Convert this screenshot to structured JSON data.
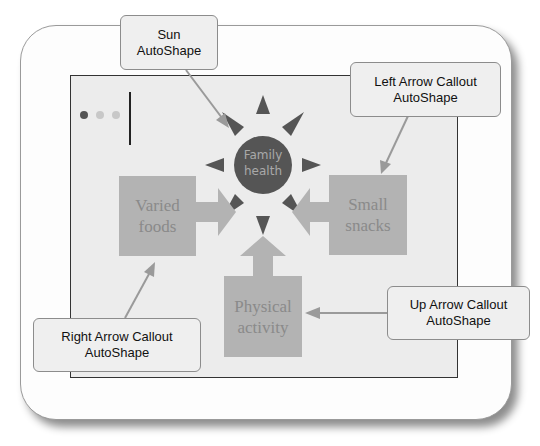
{
  "colors": {
    "slide_bg": "#ececec",
    "box_fill": "#b3b3b3",
    "box_text": "#8a8a8a",
    "sun_fill": "#555555",
    "callout_bg": "#efefef",
    "callout_border": "#8c8c8c",
    "pointer": "#9a9a9a"
  },
  "slide": {
    "bullet_dots": [
      "#555555",
      "#c8c8c8",
      "#c8c8c8"
    ]
  },
  "sun": {
    "label_line1": "Family",
    "label_line2": "health"
  },
  "boxes": {
    "varied_foods": {
      "line1": "Varied",
      "line2": "foods"
    },
    "small_snacks": {
      "line1": "Small",
      "line2": "snacks"
    },
    "physical_activity": {
      "line1": "Physical",
      "line2": "activity"
    }
  },
  "callouts": {
    "sun": {
      "line1": "Sun",
      "line2": "AutoShape"
    },
    "left_arrow": {
      "line1": "Left Arrow Callout",
      "line2": "AutoShape"
    },
    "right_arrow": {
      "line1": "Right Arrow Callout",
      "line2": "AutoShape"
    },
    "up_arrow": {
      "line1": "Up Arrow Callout",
      "line2": "AutoShape"
    }
  }
}
